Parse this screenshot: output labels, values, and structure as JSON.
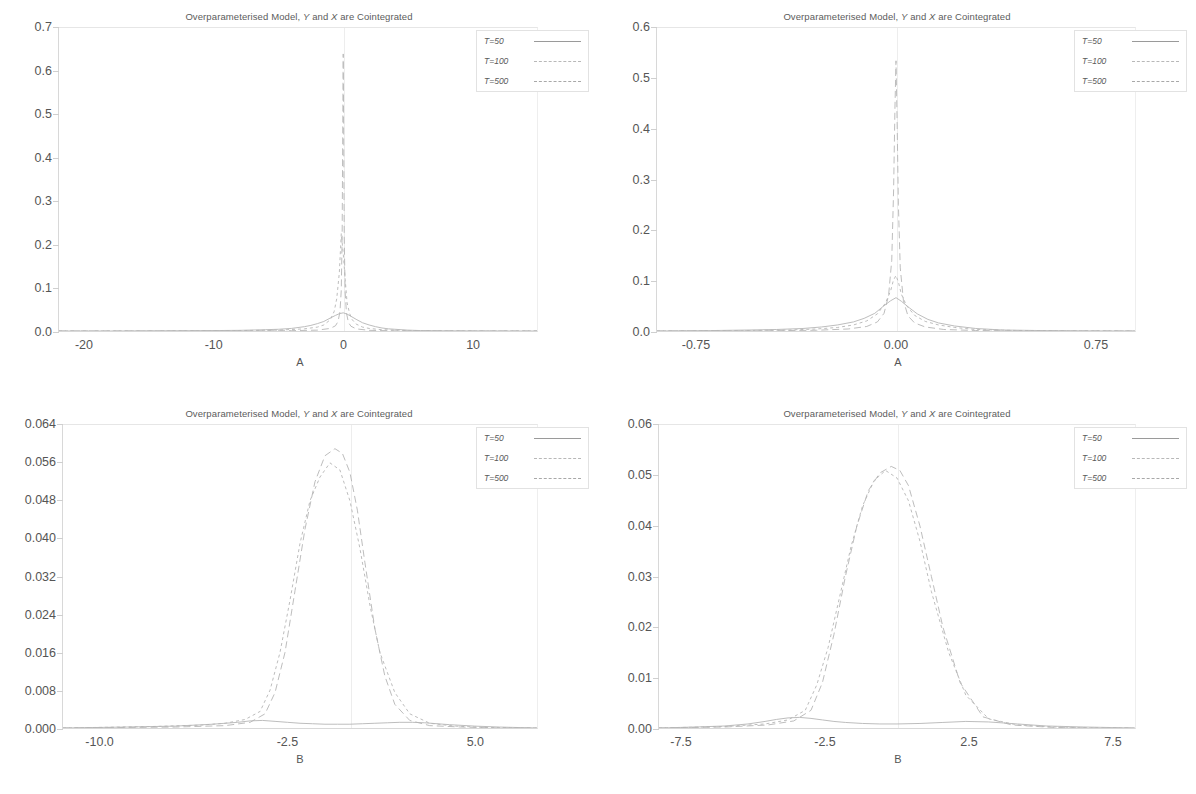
{
  "figure": {
    "shared_title_prefix": "Overparameterised Model, ",
    "shared_title_y": "Y",
    "shared_title_mid": " and ",
    "shared_title_x": "X",
    "shared_title_suffix": " are Cointegrated",
    "legend_entries": [
      "T=50",
      "T=100",
      "T=500"
    ],
    "line_color": "#b5b5b5",
    "axis_color": "#d8d8d8",
    "text_color": "#555555"
  },
  "chart_data": [
    {
      "id": "panel-top-left",
      "type": "line",
      "title": "Overparameterised Model, Y and X are Cointegrated",
      "xlabel": "A",
      "ylabel": "",
      "xlim": [
        -22.0,
        15.0
      ],
      "ylim": [
        0.0,
        0.7
      ],
      "xticks": [
        -20,
        -10,
        0,
        10
      ],
      "xticklabels": [
        "-20",
        "-10",
        "0",
        "10"
      ],
      "yticks": [
        0.0,
        0.1,
        0.2,
        0.3,
        0.4,
        0.5,
        0.6,
        0.7
      ],
      "yticklabels": [
        "0.0",
        "0.1",
        "0.2",
        "0.3",
        "0.4",
        "0.5",
        "0.6",
        "0.7"
      ],
      "grid": false,
      "legend_position": "upper right",
      "series": [
        {
          "name": "T=50",
          "style": "solid",
          "x": [
            -22,
            -18,
            -14,
            -10,
            -8,
            -6,
            -5,
            -4,
            -3.5,
            -3,
            -2.5,
            -2,
            -1.5,
            -1,
            -0.6,
            -0.3,
            0,
            0.3,
            0.6,
            1,
            1.5,
            2,
            2.5,
            3,
            3.5,
            4,
            5,
            6,
            8,
            10,
            13,
            15
          ],
          "y": [
            0.0,
            0.0,
            0.0005,
            0.001,
            0.0015,
            0.003,
            0.004,
            0.006,
            0.008,
            0.01,
            0.013,
            0.017,
            0.022,
            0.03,
            0.036,
            0.04,
            0.042,
            0.039,
            0.034,
            0.027,
            0.019,
            0.014,
            0.01,
            0.007,
            0.005,
            0.004,
            0.002,
            0.001,
            0.0005,
            0.0002,
            0.0,
            0.0
          ]
        },
        {
          "name": "T=100",
          "style": "dotted",
          "x": [
            -22,
            -16,
            -12,
            -8,
            -5,
            -3,
            -2,
            -1.5,
            -1,
            -0.7,
            -0.5,
            -0.3,
            -0.15,
            0,
            0.15,
            0.3,
            0.5,
            0.7,
            1,
            1.5,
            2,
            3,
            5,
            8,
            12,
            15
          ],
          "y": [
            0.0,
            0.0,
            0.0003,
            0.001,
            0.002,
            0.005,
            0.009,
            0.014,
            0.026,
            0.045,
            0.075,
            0.135,
            0.225,
            0.18,
            0.12,
            0.065,
            0.04,
            0.026,
            0.016,
            0.009,
            0.006,
            0.003,
            0.001,
            0.0003,
            0.0,
            0.0
          ]
        },
        {
          "name": "T=500",
          "style": "dashed",
          "x": [
            -22,
            -14,
            -8,
            -4,
            -2,
            -1,
            -0.6,
            -0.4,
            -0.25,
            -0.15,
            -0.08,
            -0.04,
            0,
            0.04,
            0.08,
            0.15,
            0.25,
            0.4,
            0.6,
            1,
            2,
            4,
            8,
            15
          ],
          "y": [
            0.0,
            0.0,
            0.0002,
            0.0008,
            0.002,
            0.006,
            0.012,
            0.022,
            0.045,
            0.095,
            0.23,
            0.45,
            0.64,
            0.43,
            0.215,
            0.09,
            0.042,
            0.02,
            0.011,
            0.005,
            0.0015,
            0.0005,
            0.0001,
            0.0
          ]
        }
      ]
    },
    {
      "id": "panel-top-right",
      "type": "line",
      "title": "Overparameterised Model, Y and X are Cointegrated",
      "xlabel": "A",
      "ylabel": "",
      "xlim": [
        -0.9,
        0.9
      ],
      "ylim": [
        0.0,
        0.6
      ],
      "xticks": [
        -0.75,
        0.0,
        0.75
      ],
      "xticklabels": [
        "-0.75",
        "0.00",
        "0.75"
      ],
      "yticks": [
        0.0,
        0.1,
        0.2,
        0.3,
        0.4,
        0.5,
        0.6
      ],
      "yticklabels": [
        "0.0",
        "0.1",
        "0.2",
        "0.3",
        "0.4",
        "0.5",
        "0.6"
      ],
      "grid": false,
      "legend_position": "upper right",
      "series": [
        {
          "name": "T=50",
          "style": "solid",
          "x": [
            -0.9,
            -0.7,
            -0.55,
            -0.45,
            -0.35,
            -0.28,
            -0.22,
            -0.16,
            -0.12,
            -0.08,
            -0.05,
            -0.02,
            0,
            0.02,
            0.05,
            0.08,
            0.12,
            0.16,
            0.22,
            0.3,
            0.4,
            0.55,
            0.7,
            0.9
          ],
          "y": [
            0.0,
            0.0008,
            0.002,
            0.003,
            0.005,
            0.008,
            0.012,
            0.018,
            0.025,
            0.035,
            0.048,
            0.06,
            0.066,
            0.059,
            0.046,
            0.034,
            0.023,
            0.016,
            0.01,
            0.005,
            0.002,
            0.0008,
            0.0003,
            0.0
          ]
        },
        {
          "name": "T=100",
          "style": "dotted",
          "x": [
            -0.9,
            -0.6,
            -0.4,
            -0.3,
            -0.22,
            -0.16,
            -0.11,
            -0.07,
            -0.04,
            -0.02,
            -0.01,
            0,
            0.01,
            0.02,
            0.04,
            0.07,
            0.11,
            0.16,
            0.22,
            0.3,
            0.45,
            0.65,
            0.9
          ],
          "y": [
            0.0,
            0.0006,
            0.002,
            0.004,
            0.007,
            0.012,
            0.02,
            0.034,
            0.055,
            0.08,
            0.1,
            0.11,
            0.095,
            0.073,
            0.05,
            0.031,
            0.019,
            0.012,
            0.007,
            0.003,
            0.001,
            0.0003,
            0.0
          ]
        },
        {
          "name": "T=500",
          "style": "dashed",
          "x": [
            -0.9,
            -0.5,
            -0.3,
            -0.18,
            -0.11,
            -0.07,
            -0.045,
            -0.028,
            -0.016,
            -0.009,
            -0.004,
            0,
            0.004,
            0.009,
            0.016,
            0.028,
            0.045,
            0.07,
            0.11,
            0.18,
            0.3,
            0.5,
            0.9
          ],
          "y": [
            0.0,
            0.0004,
            0.0015,
            0.004,
            0.009,
            0.018,
            0.035,
            0.07,
            0.14,
            0.28,
            0.44,
            0.535,
            0.42,
            0.25,
            0.125,
            0.06,
            0.03,
            0.016,
            0.008,
            0.003,
            0.001,
            0.0002,
            0.0
          ]
        }
      ]
    },
    {
      "id": "panel-bottom-left",
      "type": "line",
      "title": "Overparameterised Model, Y and X are Cointegrated",
      "xlabel": "B",
      "ylabel": "",
      "xlim": [
        -11.5,
        7.5
      ],
      "ylim": [
        0.0,
        0.064
      ],
      "xticks": [
        -10.0,
        -2.5,
        5.0
      ],
      "xticklabels": [
        "-10.0",
        "-2.5",
        "5.0"
      ],
      "yticks": [
        0.0,
        0.008,
        0.016,
        0.024,
        0.032,
        0.04,
        0.048,
        0.056,
        0.064
      ],
      "yticklabels": [
        "0.000",
        "0.008",
        "0.016",
        "0.024",
        "0.032",
        "0.040",
        "0.048",
        "0.056",
        "0.064"
      ],
      "grid": false,
      "legend_position": "upper right",
      "series": [
        {
          "name": "T=50",
          "style": "solid",
          "x": [
            -11.5,
            -9,
            -7,
            -5.5,
            -4.5,
            -4,
            -3.5,
            -3,
            -2.5,
            -2,
            -1.5,
            -1,
            -0.5,
            0,
            0.5,
            1,
            1.5,
            2,
            2.5,
            3,
            4,
            5,
            6,
            7.5
          ],
          "y": [
            0.0,
            0.0002,
            0.0004,
            0.0008,
            0.0012,
            0.0015,
            0.0016,
            0.0014,
            0.0012,
            0.001,
            0.0009,
            0.0008,
            0.0008,
            0.0008,
            0.0009,
            0.001,
            0.0011,
            0.0012,
            0.0012,
            0.0011,
            0.0007,
            0.0004,
            0.0002,
            0.0
          ]
        },
        {
          "name": "T=100",
          "style": "dotted",
          "x": [
            -11.5,
            -8,
            -6,
            -5,
            -4.2,
            -3.6,
            -3.2,
            -2.8,
            -2.4,
            -2,
            -1.6,
            -1.2,
            -0.8,
            -0.4,
            0,
            0.4,
            0.8,
            1.2,
            1.8,
            2.4,
            3.2,
            4.2,
            5.5,
            7.5
          ],
          "y": [
            0.0,
            0.0003,
            0.0006,
            0.001,
            0.0018,
            0.0035,
            0.008,
            0.016,
            0.027,
            0.039,
            0.048,
            0.053,
            0.056,
            0.0545,
            0.048,
            0.038,
            0.026,
            0.016,
            0.0075,
            0.003,
            0.001,
            0.0004,
            0.0001,
            0.0
          ]
        },
        {
          "name": "T=500",
          "style": "dashed",
          "x": [
            -11.5,
            -7,
            -5,
            -4,
            -3.4,
            -3,
            -2.6,
            -2.2,
            -1.8,
            -1.4,
            -1.0,
            -0.6,
            -0.3,
            0,
            0.3,
            0.6,
            1.0,
            1.4,
            1.8,
            2.4,
            3.2,
            4.5,
            6,
            7.5
          ],
          "y": [
            0.0,
            0.0002,
            0.0005,
            0.0012,
            0.003,
            0.0075,
            0.016,
            0.029,
            0.042,
            0.052,
            0.0575,
            0.059,
            0.058,
            0.054,
            0.046,
            0.035,
            0.021,
            0.011,
            0.005,
            0.0016,
            0.0005,
            0.0002,
            0.0,
            0.0
          ]
        }
      ]
    },
    {
      "id": "panel-bottom-right",
      "type": "line",
      "title": "Overparameterised Model, Y and X are Cointegrated",
      "xlabel": "B",
      "ylabel": "",
      "xlim": [
        -8.3,
        8.3
      ],
      "ylim": [
        0.0,
        0.06
      ],
      "xticks": [
        -7.5,
        -2.5,
        2.5,
        7.5
      ],
      "xticklabels": [
        "-7.5",
        "-2.5",
        "2.5",
        "7.5"
      ],
      "yticks": [
        0.0,
        0.01,
        0.02,
        0.03,
        0.04,
        0.05,
        0.06
      ],
      "yticklabels": [
        "0.00",
        "0.01",
        "0.02",
        "0.03",
        "0.04",
        "0.05",
        "0.06"
      ],
      "grid": false,
      "legend_position": "upper right",
      "series": [
        {
          "name": "T=50",
          "style": "solid",
          "x": [
            -8.3,
            -7,
            -6,
            -5.2,
            -4.6,
            -4.2,
            -3.8,
            -3.4,
            -3,
            -2.6,
            -2.2,
            -1.8,
            -1.2,
            -0.6,
            0,
            0.8,
            1.6,
            2.4,
            3.2,
            4.2,
            5.2,
            6.5,
            8.3
          ],
          "y": [
            0.0,
            0.0002,
            0.0004,
            0.0008,
            0.0013,
            0.0017,
            0.002,
            0.0021,
            0.0019,
            0.0016,
            0.0013,
            0.0011,
            0.0009,
            0.0008,
            0.0008,
            0.0009,
            0.0011,
            0.0013,
            0.0012,
            0.0008,
            0.0004,
            0.0002,
            0.0
          ]
        },
        {
          "name": "T=100",
          "style": "dotted",
          "x": [
            -8.3,
            -6,
            -4.6,
            -3.8,
            -3.2,
            -2.8,
            -2.4,
            -2.0,
            -1.6,
            -1.2,
            -0.8,
            -0.4,
            0,
            0.4,
            0.8,
            1.2,
            1.8,
            2.4,
            3.2,
            4.2,
            5.5,
            7,
            8.3
          ],
          "y": [
            0.0,
            0.0003,
            0.0008,
            0.0016,
            0.0035,
            0.0085,
            0.016,
            0.026,
            0.036,
            0.044,
            0.049,
            0.051,
            0.0495,
            0.045,
            0.037,
            0.027,
            0.015,
            0.0065,
            0.0018,
            0.0006,
            0.0002,
            0.0,
            0.0
          ]
        },
        {
          "name": "T=500",
          "style": "dashed",
          "x": [
            -8.3,
            -6,
            -4.5,
            -3.6,
            -3.0,
            -2.6,
            -2.2,
            -1.8,
            -1.4,
            -1.0,
            -0.6,
            -0.2,
            0.1,
            0.4,
            0.8,
            1.2,
            1.6,
            2.2,
            3.0,
            4.0,
            5.5,
            7,
            8.3
          ],
          "y": [
            0.0,
            0.0002,
            0.0006,
            0.0014,
            0.0035,
            0.009,
            0.0185,
            0.03,
            0.04,
            0.047,
            0.0505,
            0.0518,
            0.051,
            0.048,
            0.04,
            0.03,
            0.02,
            0.009,
            0.0022,
            0.0006,
            0.0001,
            0.0,
            0.0
          ]
        }
      ]
    }
  ]
}
